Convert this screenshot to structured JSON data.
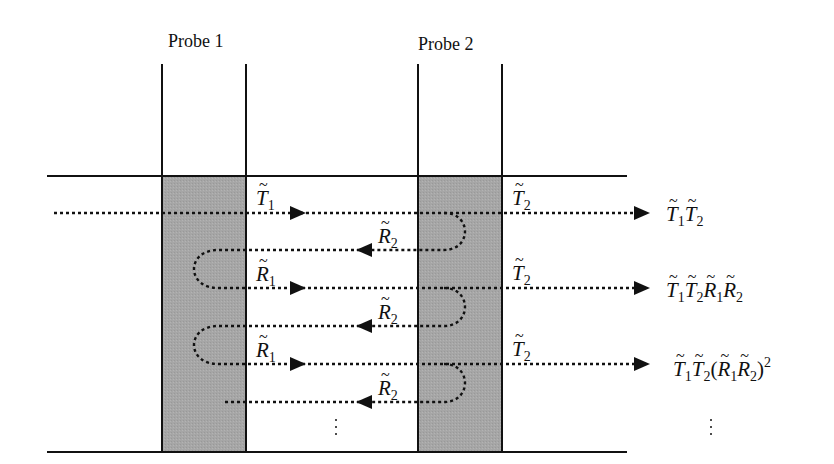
{
  "probes": [
    {
      "label": "Probe 1"
    },
    {
      "label": "Probe 2"
    }
  ],
  "interface_labels": {
    "t1": {
      "sym": "T",
      "sub": "1"
    },
    "t2_row1": {
      "sym": "T",
      "sub": "2"
    },
    "r2_row1": {
      "sym": "R",
      "sub": "2"
    },
    "r1_row2": {
      "sym": "R",
      "sub": "1"
    },
    "t2_row2": {
      "sym": "T",
      "sub": "2"
    },
    "r2_row2": {
      "sym": "R",
      "sub": "2"
    },
    "r1_row3": {
      "sym": "R",
      "sub": "1"
    },
    "t2_row3": {
      "sym": "T",
      "sub": "2"
    },
    "r2_row3": {
      "sym": "R",
      "sub": "2"
    }
  },
  "outputs": [
    {
      "expr": "T1 T2",
      "T": "T",
      "t1": "1",
      "t2": "2"
    },
    {
      "expr": "T1 T2 R1 R2",
      "T": "T",
      "R": "R",
      "t1": "1",
      "t2": "2",
      "r1": "1",
      "r2": "2"
    },
    {
      "expr": "T1 T2 (R1 R2)^2",
      "T": "T",
      "R": "R",
      "t1": "1",
      "t2": "2",
      "r1": "1",
      "r2": "2",
      "open": "(",
      "close": ")",
      "power": "2"
    }
  ],
  "colors": {
    "probe_fill": "#a6a6a6",
    "line": "#111111",
    "background": "#ffffff"
  }
}
